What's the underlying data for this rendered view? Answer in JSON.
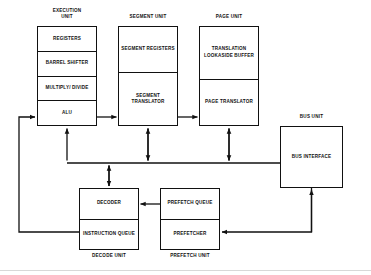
{
  "diagram": {
    "type": "block-diagram",
    "line_color": "#111111",
    "background_color": "#ffffff",
    "units": [
      {
        "id": "execution-unit",
        "caption": "EXECUTION\nUNIT",
        "caption_position": "top",
        "x": 37,
        "y": 26,
        "width": 60,
        "height": 100,
        "cells": [
          {
            "label": "REGISTERS"
          },
          {
            "label": "BARREL\nSHIFTER"
          },
          {
            "label": "MULTIPLY/\nDIVIDE"
          },
          {
            "label": "ALU"
          }
        ]
      },
      {
        "id": "segment-unit",
        "caption": "SEGMENT UNIT",
        "caption_position": "top",
        "x": 118,
        "y": 26,
        "width": 60,
        "height": 100,
        "cells": [
          {
            "label": "SEGMENT\nREGISTERS"
          },
          {
            "label": "SEGMENT\nTRANSLATOR"
          }
        ]
      },
      {
        "id": "page-unit",
        "caption": "PAGE UNIT",
        "caption_position": "top",
        "x": 199,
        "y": 26,
        "width": 60,
        "height": 100,
        "cells": [
          {
            "label": "TRANSLATION\nLOOKASIDE\nBUFFER"
          },
          {
            "label": "PAGE\nTRANSLATOR"
          }
        ]
      },
      {
        "id": "bus-unit",
        "caption": "BUS UNIT",
        "caption_position": "top",
        "x": 280,
        "y": 126,
        "width": 63,
        "height": 62,
        "cells": [
          {
            "label": "BUS INTERFACE"
          }
        ]
      },
      {
        "id": "decode-unit",
        "caption": "DECODE UNIT",
        "caption_position": "bottom",
        "x": 79,
        "y": 188,
        "width": 60,
        "height": 62,
        "cells": [
          {
            "label": "DECODER"
          },
          {
            "label": "INSTRUCTION\nQUEUE"
          }
        ]
      },
      {
        "id": "prefetch-unit",
        "caption": "PREFETCH UNIT",
        "caption_position": "bottom",
        "x": 160,
        "y": 188,
        "width": 60,
        "height": 62,
        "cells": [
          {
            "label": "PREFETCH\nQUEUE"
          },
          {
            "label": "PREFETCHER"
          }
        ]
      }
    ],
    "connections": [
      {
        "id": "alu-to-segment-translator",
        "from": "execution-unit.alu",
        "to": "segment-unit.segment-translator",
        "direction": "right"
      },
      {
        "id": "segment-translator-to-page-translator",
        "from": "segment-unit.segment-translator",
        "to": "page-unit.page-translator",
        "direction": "right"
      },
      {
        "id": "execution-unit-to-bus",
        "from": "execution-unit",
        "to": "internal-bus",
        "direction": "bidirectional"
      },
      {
        "id": "segment-unit-to-bus",
        "from": "segment-unit",
        "to": "internal-bus",
        "direction": "bidirectional"
      },
      {
        "id": "page-unit-to-bus",
        "from": "page-unit",
        "to": "internal-bus",
        "direction": "bidirectional"
      },
      {
        "id": "decode-unit-to-bus",
        "from": "decode-unit",
        "to": "internal-bus",
        "direction": "bidirectional"
      },
      {
        "id": "internal-bus-to-bus-interface",
        "from": "internal-bus",
        "to": "bus-unit",
        "direction": "right"
      },
      {
        "id": "prefetch-queue-to-decoder",
        "from": "prefetch-unit.prefetch-queue",
        "to": "decode-unit.decoder",
        "direction": "left"
      },
      {
        "id": "bus-interface-to-prefetcher",
        "from": "bus-unit",
        "to": "prefetch-unit.prefetcher",
        "direction": "left"
      },
      {
        "id": "instruction-queue-to-alu",
        "from": "decode-unit.instruction-queue",
        "to": "execution-unit.alu",
        "direction": "up-left-loop"
      }
    ]
  }
}
